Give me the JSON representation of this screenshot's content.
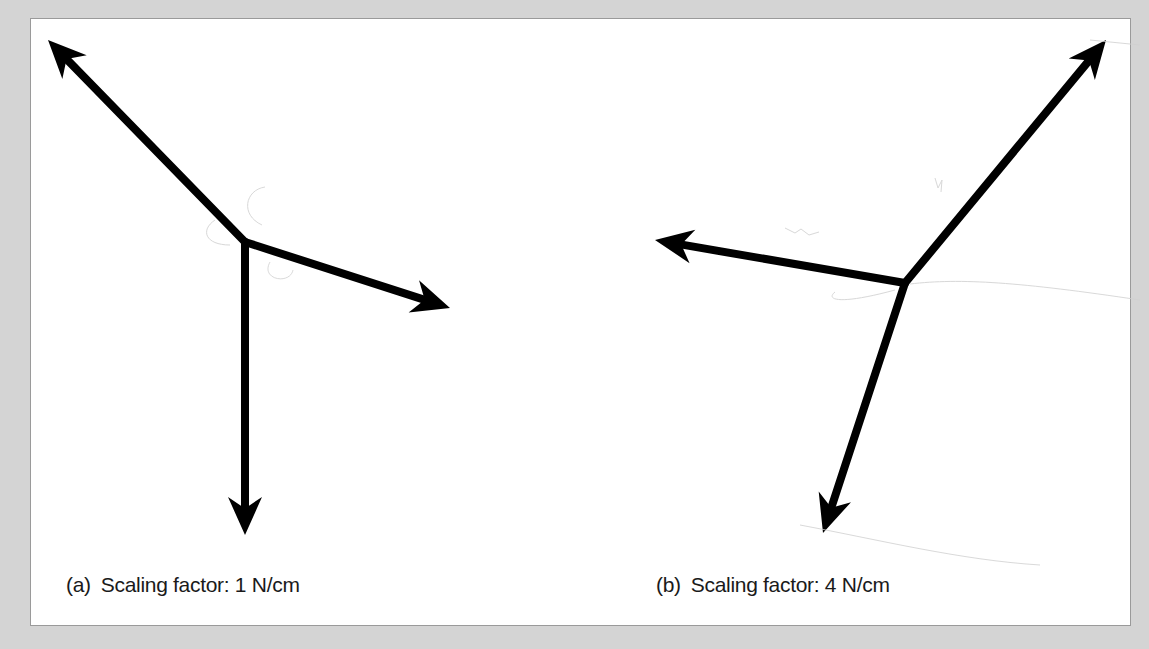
{
  "figure": {
    "background_color": "#d4d4d4",
    "panel_color": "#ffffff",
    "arrow_color": "#000000",
    "subfigures": [
      {
        "id": "a",
        "label": "(a)",
        "caption": "Scaling factor: 1 N/cm",
        "origin": [
          245,
          242
        ],
        "vectors": [
          {
            "name": "up-left",
            "tip": [
              48,
              40
            ]
          },
          {
            "name": "right-down",
            "tip": [
              450,
              308
            ]
          },
          {
            "name": "down",
            "tip": [
              245,
              535
            ]
          }
        ]
      },
      {
        "id": "b",
        "label": "(b)",
        "caption": "Scaling factor: 4 N/cm",
        "origin": [
          905,
          283
        ],
        "vectors": [
          {
            "name": "up-right",
            "tip": [
              1106,
              40
            ]
          },
          {
            "name": "left",
            "tip": [
              655,
              240
            ]
          },
          {
            "name": "down-left",
            "tip": [
              823,
              533
            ]
          }
        ]
      }
    ]
  }
}
